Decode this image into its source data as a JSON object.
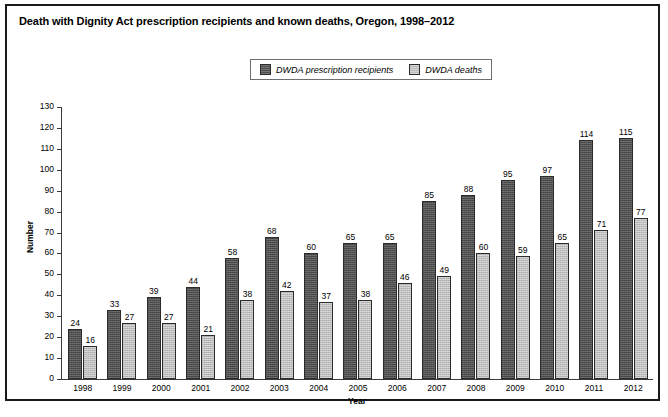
{
  "figure": {
    "title": "Death with Dignity Act prescription recipients and known deaths, Oregon, 1998–2012"
  },
  "legend": {
    "items": [
      {
        "label": "DWDA prescription recipients",
        "swatch": "dark-gray-swatch",
        "color": "#4e4e4e"
      },
      {
        "label": "DWDA deaths",
        "swatch": "light-gray-swatch",
        "color": "#bdbdbd"
      }
    ]
  },
  "chart_data": {
    "type": "bar",
    "title": "Death with Dignity Act prescription recipients and known deaths, Oregon, 1998–2012",
    "xlabel": "Year",
    "ylabel": "Number",
    "categories": [
      "1998",
      "1999",
      "2000",
      "2001",
      "2002",
      "2003",
      "2004",
      "2005",
      "2006",
      "2007",
      "2008",
      "2009",
      "2010",
      "2011",
      "2012"
    ],
    "series": [
      {
        "name": "DWDA prescription recipients",
        "color": "#4e4e4e",
        "values": [
          24,
          33,
          39,
          44,
          58,
          68,
          60,
          65,
          65,
          85,
          88,
          95,
          97,
          114,
          115
        ]
      },
      {
        "name": "DWDA deaths",
        "color": "#bdbdbd",
        "values": [
          16,
          27,
          27,
          21,
          38,
          42,
          37,
          38,
          46,
          49,
          60,
          59,
          65,
          71,
          77
        ]
      }
    ],
    "ylim": [
      0,
      130
    ],
    "yticks": [
      0,
      10,
      20,
      30,
      40,
      50,
      60,
      70,
      80,
      90,
      100,
      110,
      120,
      130
    ],
    "grid": false,
    "legend_position": "top-center",
    "data_labels": true
  }
}
